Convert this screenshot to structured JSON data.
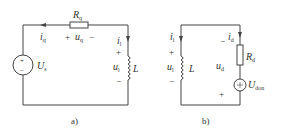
{
  "circuit_a": {
    "caption": "a)",
    "source": {
      "symbol": "U",
      "sub": "s",
      "plus": "+",
      "minus": "−"
    },
    "resistor": {
      "symbol": "R",
      "sub": "q"
    },
    "current_q": {
      "symbol": "i",
      "sub": "q"
    },
    "voltage_q": {
      "plus": "+",
      "symbol": "u",
      "sub": "q",
      "minus": "−"
    },
    "current_l": {
      "symbol": "i",
      "sub": "l"
    },
    "voltage_l": {
      "plus": "+",
      "symbol": "u",
      "sub": "l",
      "minus": "−"
    },
    "inductor": {
      "symbol": "L"
    }
  },
  "circuit_b": {
    "caption": "b)",
    "current_l": {
      "symbol": "i",
      "sub": "l"
    },
    "voltage_l": {
      "plus": "+",
      "symbol": "u",
      "sub": "l",
      "minus": "−"
    },
    "inductor": {
      "symbol": "L"
    },
    "current_d": {
      "symbol": "i",
      "sub": "d"
    },
    "resistor": {
      "symbol": "R",
      "sub": "d"
    },
    "voltage_d": {
      "minus": "−",
      "symbol": "u",
      "sub": "d",
      "plus": "+"
    },
    "source": {
      "symbol": "U",
      "sub": "don"
    }
  }
}
